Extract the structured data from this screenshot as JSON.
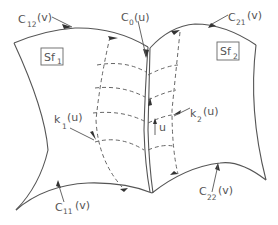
{
  "diagram": {
    "type": "surface-patch-schematic",
    "patches": [
      {
        "id": "Sf1",
        "label_main": "Sf",
        "label_sub": "1"
      },
      {
        "id": "Sf2",
        "label_main": "Sf",
        "label_sub": "2"
      }
    ],
    "curves": {
      "c12": {
        "main": "C",
        "sub": "12",
        "arg": "(v)"
      },
      "c0": {
        "main": "C",
        "sub": "0",
        "arg": "(u)"
      },
      "c21": {
        "main": "C",
        "sub": "21",
        "arg": "(v)"
      },
      "k1": {
        "main": "k",
        "sub": "1",
        "arg": "(u)"
      },
      "k2": {
        "main": "k",
        "sub": "2",
        "arg": "(u)"
      },
      "c11": {
        "main": "C",
        "sub": "11",
        "arg": "(v)"
      },
      "c22": {
        "main": "C",
        "sub": "22",
        "arg": "(v)"
      }
    },
    "param_label": "u",
    "colors": {
      "line": "#555555",
      "dashed": "#666666",
      "background": "#ffffff"
    }
  }
}
